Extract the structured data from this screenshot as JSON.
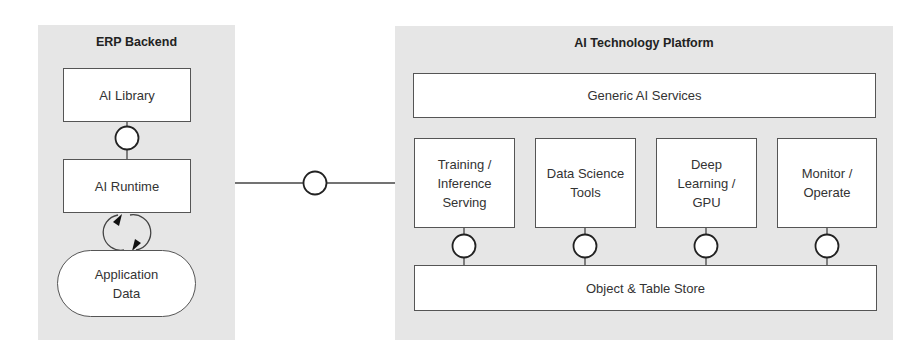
{
  "erp_backend": {
    "title": "ERP Backend",
    "ai_library": "AI Library",
    "ai_runtime": "AI Runtime",
    "application_data": "Application\nData"
  },
  "ai_platform": {
    "title": "AI Technology Platform",
    "generic_services": "Generic AI Services",
    "components": [
      {
        "label": "Training /\nInference\nServing"
      },
      {
        "label": "Data Science\nTools"
      },
      {
        "label": "Deep\nLearning /\nGPU"
      },
      {
        "label": "Monitor /\nOperate"
      }
    ],
    "store": "Object & Table Store"
  },
  "colors": {
    "panel": "#e6e6e6",
    "box": "#ffffff",
    "stroke": "#555555"
  }
}
